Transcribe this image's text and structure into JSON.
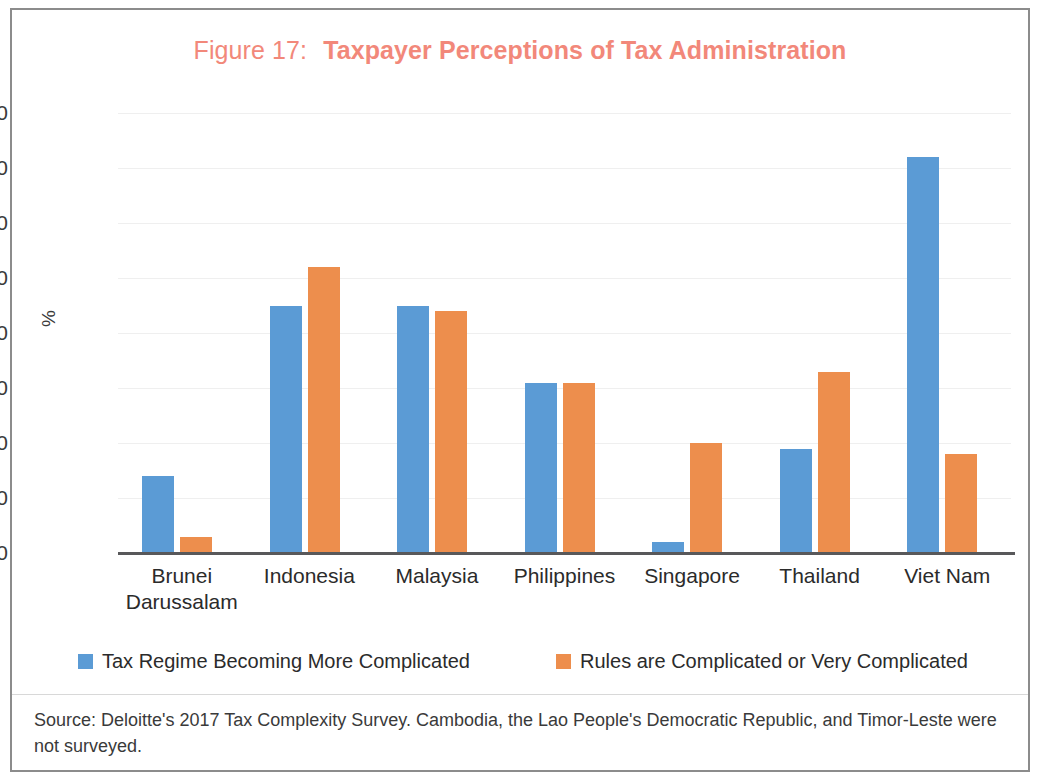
{
  "figure": {
    "number_label": "Figure 17:",
    "title": "Taxpayer Perceptions of Tax Administration",
    "title_color": "#f2887a",
    "source_note": "Source: Deloitte's 2017 Tax Complexity Survey. Cambodia, the Lao People's Democratic Republic, and Timor-Leste were not surveyed."
  },
  "chart_data": {
    "type": "bar",
    "xlabel": "",
    "ylabel": "%",
    "ylim": [
      0,
      80
    ],
    "yticks": [
      0,
      10,
      20,
      30,
      40,
      50,
      60,
      70,
      80
    ],
    "ytick_labels": [
      "0",
      "10",
      "20",
      "30",
      "40",
      "50",
      "60",
      "70",
      "80"
    ],
    "grid": true,
    "legend_position": "bottom",
    "categories": [
      "Brunei\nDarussalam",
      "Indonesia",
      "Malaysia",
      "Philippines",
      "Singapore",
      "Thailand",
      "Viet Nam"
    ],
    "category_lines": [
      [
        "Brunei",
        "Darussalam"
      ],
      [
        "Indonesia"
      ],
      [
        "Malaysia"
      ],
      [
        "Philippines"
      ],
      [
        "Singapore"
      ],
      [
        "Thailand"
      ],
      [
        "Viet Nam"
      ]
    ],
    "series": [
      {
        "name": "Tax Regime Becoming More Complicated",
        "color": "#5b9bd5",
        "values": [
          14,
          45,
          45,
          31,
          2,
          19,
          72
        ]
      },
      {
        "name": "Rules are Complicated or Very Complicated",
        "color": "#ed8e4d",
        "values": [
          3,
          52,
          44,
          31,
          20,
          33,
          18
        ]
      }
    ]
  }
}
